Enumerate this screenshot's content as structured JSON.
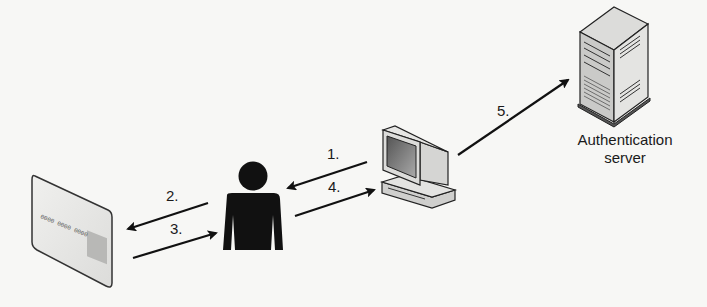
{
  "diagram": {
    "nodes": {
      "card": {
        "name": "smart-card"
      },
      "user": {
        "name": "user"
      },
      "computer": {
        "name": "workstation"
      },
      "server": {
        "name": "authentication-server",
        "label_line1": "Authentication",
        "label_line2": "server"
      }
    },
    "steps": [
      {
        "label": "1.",
        "from": "computer",
        "to": "user"
      },
      {
        "label": "2.",
        "from": "user",
        "to": "card"
      },
      {
        "label": "3.",
        "from": "card",
        "to": "user"
      },
      {
        "label": "4.",
        "from": "user",
        "to": "computer"
      },
      {
        "label": "5.",
        "from": "computer",
        "to": "server"
      }
    ],
    "card_number_text": "0000 0000 0000"
  }
}
